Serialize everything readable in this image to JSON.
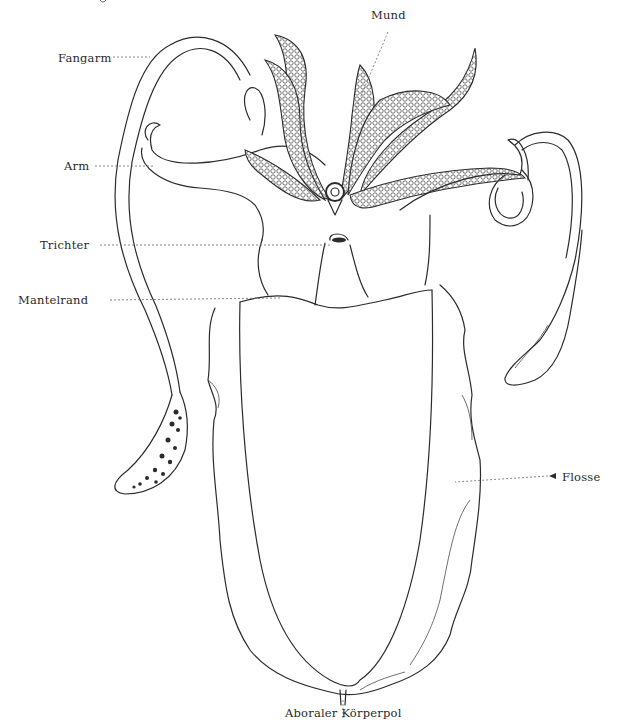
{
  "figure": {
    "labels": [
      {
        "id": "mund",
        "text": "Mund"
      },
      {
        "id": "fangarm",
        "text": "Fangarm"
      },
      {
        "id": "arm",
        "text": "Arm"
      },
      {
        "id": "trichter",
        "text": "Trichter"
      },
      {
        "id": "mantelrand",
        "text": "Mantelrand"
      },
      {
        "id": "flosse",
        "text": "Flosse"
      },
      {
        "id": "aboraler_koerperpol",
        "text": "Aboraler Körperpol"
      }
    ],
    "colors": {
      "ink": "#2b2b2b",
      "paper": "#ffffff",
      "leader": "#6a6a6a"
    }
  }
}
